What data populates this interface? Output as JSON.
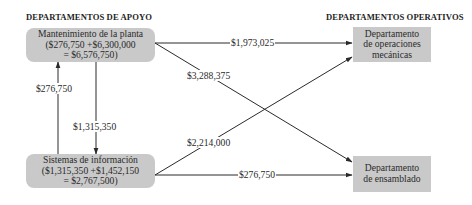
{
  "headings": {
    "support": "DEPARTAMENTOS DE APOYO",
    "operating": "DEPARTAMENTOS OPERATIVOS"
  },
  "support_departments": [
    {
      "name": "Mantenimiento de la planta",
      "line2": "($276,750 +$6,300,000",
      "line3": "= $6,576,750)"
    },
    {
      "name": "Sistemas de información",
      "line2": "($1,315,350 +$1,452,150",
      "line3": "= $2,767,500)"
    }
  ],
  "operating_departments": [
    {
      "line1": "Departamento",
      "line2": "de operaciones",
      "line3": "mecánicas"
    },
    {
      "line1": "Departamento",
      "line2": "de ensamblado"
    }
  ],
  "flows": [
    {
      "from": "Mantenimiento de la planta",
      "to": "Departamento de operaciones mecánicas",
      "amount": "$1,973,025"
    },
    {
      "from": "Mantenimiento de la planta",
      "to": "Departamento de ensamblado",
      "amount": "$3,288,375"
    },
    {
      "from": "Mantenimiento de la planta",
      "to": "Sistemas de información",
      "amount": "$1,315,350"
    },
    {
      "from": "Sistemas de información",
      "to": "Mantenimiento de la planta",
      "amount": "$276,750"
    },
    {
      "from": "Sistemas de información",
      "to": "Departamento de operaciones mecánicas",
      "amount": "$2,214,000"
    },
    {
      "from": "Sistemas de información",
      "to": "Departamento de ensamblado",
      "amount": "$276,750"
    }
  ],
  "colors": {
    "box_fill": "#c9c9c9",
    "arrow": "#2a2a2a",
    "text": "#2a2a2a"
  }
}
